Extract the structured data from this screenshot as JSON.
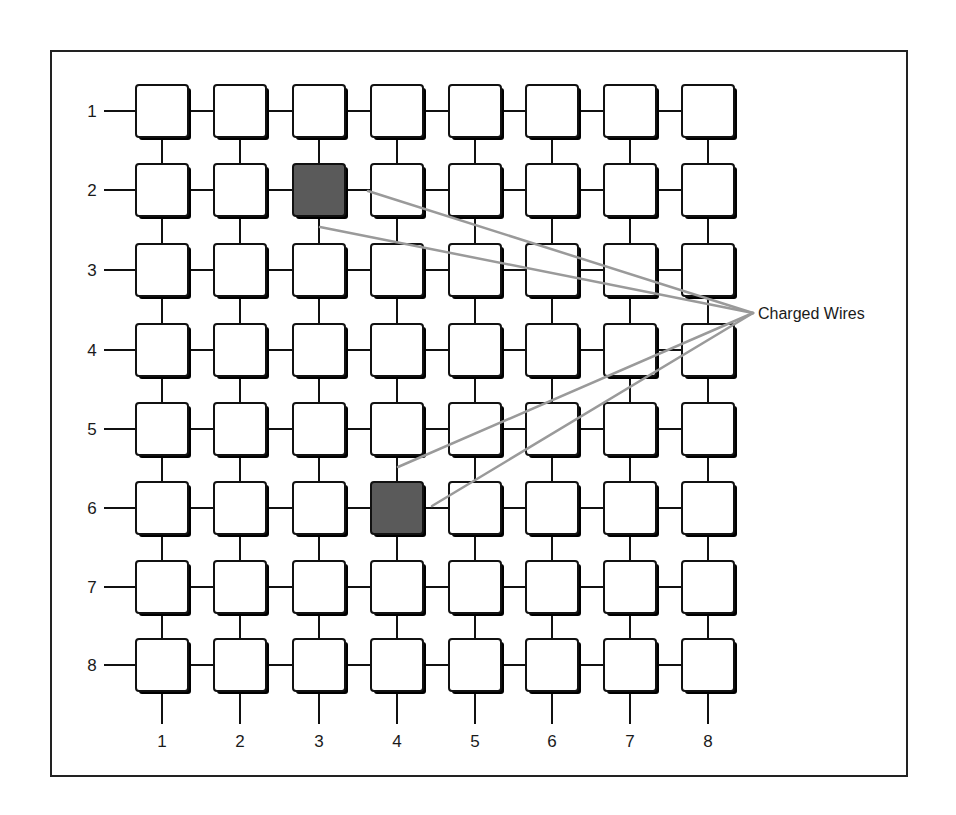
{
  "figure": {
    "type": "crosspoint-grid-diagram",
    "rows": 8,
    "cols": 8,
    "row_labels": [
      "1",
      "2",
      "3",
      "4",
      "5",
      "6",
      "7",
      "8"
    ],
    "col_labels": [
      "1",
      "2",
      "3",
      "4",
      "5",
      "6",
      "7",
      "8"
    ],
    "selected_cells": [
      {
        "row": 2,
        "col": 3
      },
      {
        "row": 6,
        "col": 4
      }
    ],
    "annotation": {
      "label": "Charged Wires",
      "pointer_count": 4
    },
    "colors": {
      "box_fill": "#ffffff",
      "box_stroke": "#111111",
      "selected_fill": "#5a5a5a",
      "pointer_line": "#9a9a9a",
      "frame": "#222222",
      "wire": "#111111"
    }
  }
}
